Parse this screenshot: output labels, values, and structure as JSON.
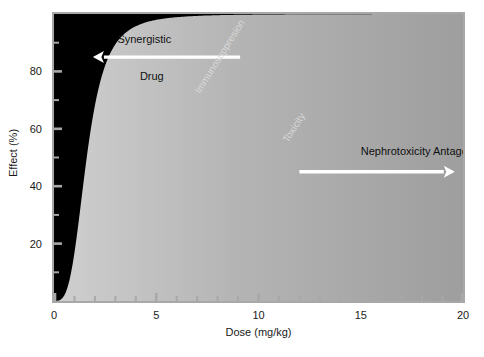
{
  "chart_data": {
    "type": "area",
    "title": "",
    "xlabel": "Dose (mg/kg)",
    "ylabel": "Effect (%)",
    "xlim": [
      0,
      20
    ],
    "ylim": [
      0,
      100
    ],
    "grid": false,
    "legend": "inline-labels",
    "x_ticks_major": [
      0,
      5,
      10,
      15,
      20
    ],
    "x_ticks_major_labels": [
      "0",
      "5",
      "10",
      "15",
      "20"
    ],
    "x_ticks_minor": [
      1,
      2,
      3,
      4,
      6,
      7,
      8,
      9,
      11,
      12,
      13,
      14,
      16,
      17,
      18,
      19
    ],
    "y_ticks_major": [
      20,
      40,
      60,
      80
    ],
    "y_ticks_major_labels": [
      "20",
      "40",
      "60",
      "80"
    ],
    "y_ticks_minor": [
      10,
      30,
      50,
      70,
      90
    ],
    "series": [
      {
        "name": "Synergistic Drug",
        "fill": "#b9b9b9",
        "ed50": 1.6,
        "hill": 3.4,
        "emax": 100,
        "x": [
          0,
          0.4,
          0.8,
          1.0,
          1.2,
          1.4,
          1.6,
          1.8,
          2.0,
          2.4,
          2.8,
          3.2,
          4.0,
          5.0,
          6.5,
          8.0,
          10.0,
          13.0,
          16.0,
          20.0
        ],
        "y": [
          0,
          1.5,
          10,
          18,
          30,
          42,
          50,
          58,
          66,
          77,
          84,
          88,
          93,
          96,
          98,
          98.6,
          99,
          99.4,
          99.6,
          99.8
        ]
      },
      {
        "name": "Immunosuppresion",
        "fill": "#5d5d5d",
        "ed50": 5.2,
        "hill": 3.0,
        "emax": 100,
        "x": [
          0,
          1.0,
          2.0,
          2.6,
          3.2,
          3.8,
          4.4,
          5.0,
          5.6,
          6.2,
          7.0,
          8.0,
          9.2,
          10.5,
          12.0,
          14.0,
          16.0,
          18.0,
          20.0
        ],
        "y": [
          0,
          0.8,
          6,
          12,
          20,
          29,
          40,
          49,
          58,
          66,
          74,
          82,
          88,
          91.5,
          94,
          96,
          97.2,
          98,
          98.6
        ]
      },
      {
        "name": "Toxicity",
        "fill": "#5d5d5d",
        "ed50": 11.5,
        "hill": 3.2,
        "emax": 100,
        "x": [
          0,
          2.0,
          4.0,
          5.5,
          7.0,
          8.0,
          9.0,
          10.0,
          11.0,
          12.0,
          13.0,
          14.0,
          15.0,
          16.5,
          18.0,
          19.0,
          20.0
        ],
        "y": [
          0,
          0.4,
          3,
          7,
          14,
          20,
          28,
          37,
          46,
          56,
          65,
          72,
          78,
          85,
          90,
          92,
          94
        ]
      },
      {
        "name": "Nephrotoxicity Antagonist",
        "fill": "#5d5d5d",
        "ed50": 18.6,
        "hill": 4.0,
        "emax": 100,
        "x": [
          0,
          6.0,
          9.0,
          11.0,
          13.0,
          14.5,
          16.0,
          17.0,
          18.0,
          19.0,
          19.5,
          20.0
        ],
        "y": [
          0,
          0.3,
          1.2,
          2.6,
          5.5,
          9,
          15,
          21,
          29,
          38,
          44,
          50
        ]
      }
    ],
    "annotations": [
      {
        "text": "Synergistic",
        "x": 3.1,
        "y": 91,
        "color": "#101010"
      },
      {
        "text": "Drug",
        "x": 4.2,
        "y": 78,
        "color": "#101010"
      },
      {
        "text": "Immunosuppresion",
        "x": 7.0,
        "y": 72,
        "rotation": -58,
        "color": "#d8d8d8"
      },
      {
        "text": "Toxicity",
        "x": 11.3,
        "y": 55,
        "rotation": -58,
        "color": "#d8d8d8"
      },
      {
        "text": "Nephrotoxicity Antagonist",
        "x": 15.0,
        "y": 52,
        "color": "#101010"
      }
    ],
    "arrows": [
      {
        "label": "Synergistic Drug",
        "direction": "left",
        "x_start": 9.1,
        "x_end": 1.9,
        "y": 85,
        "color": "#ffffff"
      },
      {
        "label": "Nephrotoxicity Antagonist",
        "direction": "right",
        "x_start": 12.0,
        "x_end": 19.6,
        "y": 45,
        "color": "#ffffff"
      }
    ]
  },
  "axes": {
    "y": {
      "title": "Effect (%)",
      "ticks": [
        {
          "value": 20,
          "label": "20"
        },
        {
          "value": 40,
          "label": "40"
        },
        {
          "value": 60,
          "label": "60"
        },
        {
          "value": 80,
          "label": "80"
        }
      ]
    },
    "x": {
      "title": "Dose (mg/kg)",
      "ticks": [
        {
          "value": 0,
          "label": "0"
        },
        {
          "value": 5,
          "label": "5"
        },
        {
          "value": 10,
          "label": "10"
        },
        {
          "value": 15,
          "label": "15"
        },
        {
          "value": 20,
          "label": "20"
        }
      ]
    }
  },
  "labels": {
    "synergistic": "Synergistic",
    "drug": "Drug",
    "immunosuppresion": "Immunosuppresion",
    "toxicity": "Toxicity",
    "nephrotoxicity_antagonist": "Nephrotoxicity Antagonist"
  },
  "caption": {
    "text": ""
  },
  "colors": {
    "background": "#ffffff",
    "plot_background": "#000000",
    "frame": "#a8a8a8",
    "band_light": "#b9b9b9",
    "band_mid": "#5d5d5d",
    "band_dark": "#000000",
    "arrow": "#ffffff",
    "axis_text": "#1a1a1a",
    "band_label_text": "#d8d8d8"
  }
}
